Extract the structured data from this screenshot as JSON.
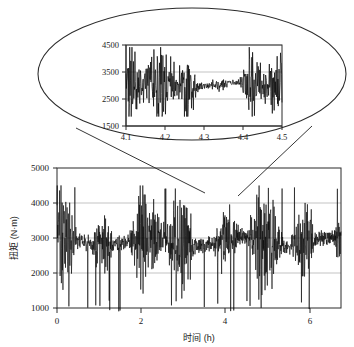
{
  "figure": {
    "name": "torque-time-series-with-zoom-inset",
    "background_color": "#ffffff",
    "line_color": "#0a0a0a",
    "axis_color": "#2b2b2b",
    "grid_color": "#a9a9a9"
  },
  "caption": {
    "partial_bottom_text": ""
  },
  "chart_data": [
    {
      "id": "main",
      "type": "line",
      "title": "",
      "xlabel": "时间 (h)",
      "ylabel": "扭矩 (N·m)",
      "xlim": [
        0,
        6.75
      ],
      "ylim": [
        1000,
        5000
      ],
      "xticks": [
        0,
        2,
        4,
        6
      ],
      "xtick_labels": [
        "0",
        "2",
        "4",
        "6"
      ],
      "yticks": [
        1000,
        2000,
        3000,
        4000,
        5000
      ],
      "ytick_labels": [
        "1000",
        "2000",
        "3000",
        "4000",
        "5000"
      ],
      "grid": "horizontal",
      "legend": "none",
      "series_name": "torque",
      "n_points": 1100,
      "signal_description": "High-frequency torque oscillation, band roughly 1200-4500 N·m with occasional drops near 900",
      "envelope_mean": 2900,
      "envelope_high": 4450,
      "envelope_low": 1250,
      "notes": "Dense noisy trace spanning full 0-6.75 h record"
    },
    {
      "id": "inset",
      "type": "line",
      "title": "",
      "xlabel": "",
      "ylabel": "",
      "xlim": [
        4.1,
        4.5
      ],
      "ylim": [
        1500,
        4500
      ],
      "xticks": [
        4.1,
        4.2,
        4.3,
        4.4,
        4.5
      ],
      "xtick_labels": [
        "4.1",
        "4.2",
        "4.3",
        "4.4",
        "4.5"
      ],
      "yticks": [
        1500,
        2500,
        3500,
        4500
      ],
      "ytick_labels": [
        "1500",
        "2500",
        "3500",
        "4500"
      ],
      "grid": "horizontal",
      "legend": "none",
      "series_name": "torque-zoom",
      "n_points": 420,
      "signal_description": "Magnified 4.1-4.5 h window; oscillation band 2000-4400 with a calm plateau near 3000 between 4.29 and 4.40",
      "envelope_mean": 3150,
      "envelope_high": 4400,
      "envelope_low": 1950,
      "notes": "Callout detail of the boxed region of the main record"
    }
  ],
  "annotations": {
    "zoom_callout": {
      "shape": "ellipse",
      "label": "zoom-callout-ellipse",
      "leader_lines": 2
    }
  }
}
